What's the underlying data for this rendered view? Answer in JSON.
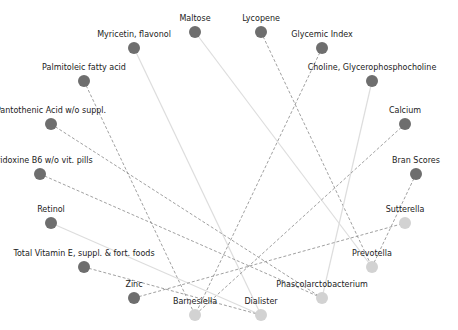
{
  "diagram": {
    "type": "bipartite-network",
    "colors": {
      "food_node": "#6e6e6e",
      "bacteria_node": "#d2d2d2",
      "edge_solid": "#dddddd",
      "edge_dashed": "#888888",
      "label": "#222222"
    },
    "nodes": [
      {
        "id": "maltose",
        "label": "Maltose",
        "x": 195,
        "y": 32,
        "group": "food"
      },
      {
        "id": "lycopene",
        "label": "Lycopene",
        "x": 261,
        "y": 32,
        "group": "food"
      },
      {
        "id": "myricetin",
        "label": "Myricetin, flavonol",
        "x": 134,
        "y": 48,
        "group": "food"
      },
      {
        "id": "glycemic",
        "label": "Glycemic Index",
        "x": 322,
        "y": 48,
        "group": "food"
      },
      {
        "id": "palmitoleic",
        "label": "Palmitoleic fatty acid",
        "x": 84,
        "y": 81,
        "group": "food"
      },
      {
        "id": "choline",
        "label": "Choline, Glycerophosphocholine",
        "x": 372,
        "y": 81,
        "group": "food"
      },
      {
        "id": "pantothenic",
        "label": "Pantothenic Acid w/o suppl.",
        "x": 51,
        "y": 124,
        "group": "food"
      },
      {
        "id": "calcium",
        "label": "Calcium",
        "x": 405,
        "y": 124,
        "group": "food"
      },
      {
        "id": "pyridoxine",
        "label": "Pyridoxine B6 w/o vit. pills",
        "x": 40,
        "y": 174,
        "group": "food"
      },
      {
        "id": "bran",
        "label": "Bran Scores",
        "x": 416,
        "y": 174,
        "group": "food"
      },
      {
        "id": "retinol",
        "label": "Retinol",
        "x": 51,
        "y": 223,
        "group": "food"
      },
      {
        "id": "sutterella",
        "label": "Sutterella",
        "x": 405,
        "y": 223,
        "group": "bacteria"
      },
      {
        "id": "vitamine",
        "label": "Total Vitamin E, suppl. & fort. foods",
        "x": 84,
        "y": 267,
        "group": "food"
      },
      {
        "id": "prevotella",
        "label": "Prevotella",
        "x": 372,
        "y": 267,
        "group": "bacteria"
      },
      {
        "id": "zinc",
        "label": "Zinc",
        "x": 134,
        "y": 298,
        "group": "food"
      },
      {
        "id": "phascolarcto",
        "label": "Phascolarctobacterium",
        "x": 322,
        "y": 298,
        "group": "bacteria"
      },
      {
        "id": "barnesiella",
        "label": "Barnesiella",
        "x": 195,
        "y": 315,
        "group": "bacteria"
      },
      {
        "id": "dialister",
        "label": "Dialister",
        "x": 261,
        "y": 315,
        "group": "bacteria"
      }
    ],
    "edges": [
      {
        "source": "myricetin",
        "target": "dialister",
        "style": "solid"
      },
      {
        "source": "maltose",
        "target": "prevotella",
        "style": "solid"
      },
      {
        "source": "lycopene",
        "target": "prevotella",
        "style": "dashed"
      },
      {
        "source": "glycemic",
        "target": "barnesiella",
        "style": "dashed"
      },
      {
        "source": "choline",
        "target": "phascolarcto",
        "style": "solid"
      },
      {
        "source": "calcium",
        "target": "barnesiella",
        "style": "dashed"
      },
      {
        "source": "palmitoleic",
        "target": "barnesiella",
        "style": "dashed"
      },
      {
        "source": "pantothenic",
        "target": "phascolarcto",
        "style": "dashed"
      },
      {
        "source": "pyridoxine",
        "target": "phascolarcto",
        "style": "dashed"
      },
      {
        "source": "retinol",
        "target": "dialister",
        "style": "solid"
      },
      {
        "source": "vitamine",
        "target": "dialister",
        "style": "dashed"
      },
      {
        "source": "zinc",
        "target": "sutterella",
        "style": "dashed"
      },
      {
        "source": "bran",
        "target": "prevotella",
        "style": "dashed"
      }
    ]
  }
}
